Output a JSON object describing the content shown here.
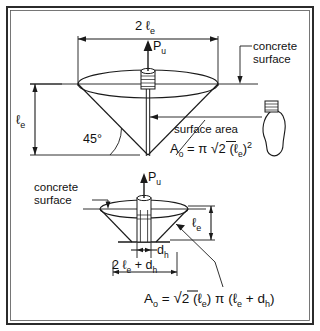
{
  "figure": {
    "background_color": "#ffffff",
    "line_color": "#1a1a1a",
    "border_color": "#2b2b2b"
  },
  "top_diagram": {
    "name": "full-depth-shear-cone",
    "labels": {
      "width_dim": "2 ℓ",
      "width_dim_sub": "e",
      "load_arrow": "P",
      "load_arrow_sub": "u",
      "concrete_surface_line1": "concrete",
      "concrete_surface_line2": "surface",
      "depth_dim": "ℓ",
      "depth_dim_sub": "e",
      "angle": "45°",
      "callout": "surface area"
    },
    "formula": {
      "lhs": "A",
      "lhs_sub": "o",
      "equals": "=",
      "pi": "π",
      "radical": "√",
      "radicand": "2",
      "paren_open": "(",
      "ell": "ℓ",
      "ell_sub": "e",
      "paren_close": ")",
      "exponent": "2",
      "plain_text": "Aₒ = π √2 (ℓₑ)²"
    }
  },
  "bottom_diagram": {
    "name": "truncated-shear-cone",
    "labels": {
      "concrete_surface_line1": "concrete",
      "concrete_surface_line2": "surface",
      "load_arrow": "P",
      "load_arrow_sub": "u",
      "depth_dim": "ℓ",
      "depth_dim_sub": "e",
      "head_dia": "d",
      "head_dia_sub": "h",
      "width_dim_a": "2 ℓ",
      "width_dim_a_sub": "e",
      "width_dim_plus": "+ d",
      "width_dim_b_sub": "h"
    },
    "formula": {
      "lhs": "A",
      "lhs_sub": "o",
      "equals": "=",
      "radical": "√",
      "radicand": "2",
      "ell": "ℓ",
      "ell_sub": "e",
      "pi": "π",
      "plus": "+",
      "dh": "d",
      "dh_sub": "h",
      "plain_text": "Aₒ = √2 (ℓₑ) π (ℓₑ + dₕ)"
    }
  }
}
